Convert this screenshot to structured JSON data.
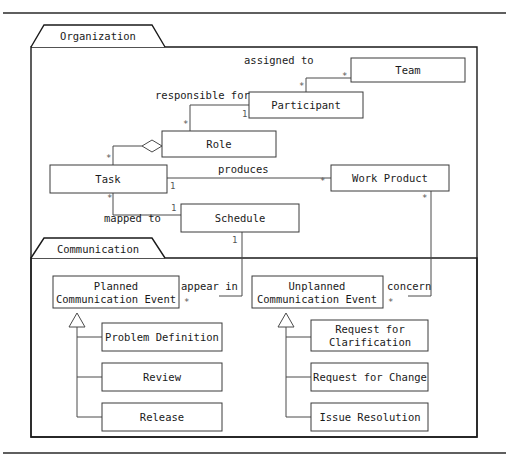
{
  "diagram": {
    "type": "uml-class-diagram",
    "stroke_color": "#3a3a3a",
    "package_border_color": "#1a1a1a",
    "background": "#ffffff"
  },
  "packages": [
    {
      "name": "organization",
      "label": "Organization"
    },
    {
      "name": "communication",
      "label": "Communication"
    }
  ],
  "classes": [
    {
      "name": "team",
      "label": "Team"
    },
    {
      "name": "participant",
      "label": "Participant"
    },
    {
      "name": "role",
      "label": "Role"
    },
    {
      "name": "task",
      "label": "Task"
    },
    {
      "name": "work-product",
      "label": "Work Product"
    },
    {
      "name": "schedule",
      "label": "Schedule"
    },
    {
      "name": "planned-communication-event",
      "label_line1": "Planned",
      "label_line2": "Communication Event"
    },
    {
      "name": "unplanned-communication-event",
      "label_line1": "Unplanned",
      "label_line2": "Communication Event"
    },
    {
      "name": "problem-definition",
      "label": "Problem Definition"
    },
    {
      "name": "review",
      "label": "Review"
    },
    {
      "name": "release",
      "label": "Release"
    },
    {
      "name": "request-for-clarification",
      "label_line1": "Request for",
      "label_line2": "Clarification"
    },
    {
      "name": "request-for-change",
      "label": "Request for Change"
    },
    {
      "name": "issue-resolution",
      "label": "Issue Resolution"
    }
  ],
  "associations": [
    {
      "name": "participant-assigned-to-team",
      "label": "assigned to",
      "source": "Participant",
      "target": "Team",
      "source_multiplicity": "*",
      "target_multiplicity": "*"
    },
    {
      "name": "participant-responsible-for-role",
      "label": "responsible for",
      "source": "Participant",
      "target": "Role",
      "source_multiplicity": "1",
      "target_multiplicity": "*"
    },
    {
      "name": "task-produces-work-product",
      "label": "produces",
      "source": "Task",
      "target": "Work Product",
      "source_multiplicity": "1",
      "target_multiplicity": "*"
    },
    {
      "name": "task-mapped-to-schedule",
      "label": "mapped to",
      "source": "Task",
      "target": "Schedule",
      "source_multiplicity": "*",
      "target_multiplicity": "1"
    },
    {
      "name": "schedule-appear-in-planned-event",
      "label": "appear in",
      "source": "Schedule",
      "target": "Planned Communication Event",
      "source_multiplicity": "1",
      "target_multiplicity": "*"
    },
    {
      "name": "work-product-concern-unplanned-event",
      "label": "concern",
      "source": "Work Product",
      "target": "Unplanned Communication Event",
      "source_multiplicity": "*",
      "target_multiplicity": "*"
    }
  ],
  "aggregations": [
    {
      "name": "role-aggregates-task",
      "whole": "Role",
      "part": "Task",
      "part_multiplicity": "*"
    }
  ],
  "generalizations": [
    {
      "name": "gen-planned",
      "parent": "Planned Communication Event",
      "children": [
        "Problem Definition",
        "Review",
        "Release"
      ]
    },
    {
      "name": "gen-unplanned",
      "parent": "Unplanned Communication Event",
      "children": [
        "Request for Clarification",
        "Request for Change",
        "Issue Resolution"
      ]
    }
  ],
  "multiplicity_labels": {
    "team_end": "*",
    "participant_to_team_end": "*",
    "participant_to_role_end": "1",
    "role_end": "*",
    "task_produces_end": "1",
    "work_product_end": "*",
    "task_mapped_end": "*",
    "schedule_end": "1",
    "schedule_down_end": "1",
    "planned_event_end": "*",
    "work_product_down_end": "*",
    "unplanned_event_end": "*",
    "role_aggregation_task_end": "*"
  }
}
